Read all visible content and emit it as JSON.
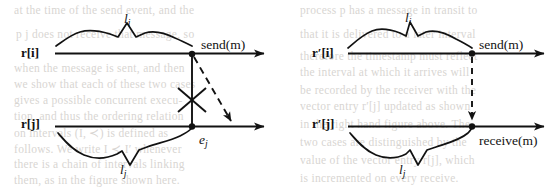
{
  "figure": {
    "name": "message-send-receive-timeline-diagram",
    "ink_color": "#121212",
    "paper_color": "#ffffff",
    "bleed_color": "#b9b4ae"
  },
  "left_diagram": {
    "name": "left-diagram",
    "timelines": [
      {
        "axis_label": "r[i]",
        "interval_label": "l",
        "interval_sub": "i"
      },
      {
        "axis_label": "r[j]",
        "interval_label": "l",
        "interval_sub": "j"
      }
    ],
    "events": [
      {
        "label": "send(m)",
        "name": "send-event-label"
      },
      {
        "label": "e",
        "sub": "j",
        "name": "ej-event-label"
      }
    ],
    "message_arrow": {
      "style": "dashed",
      "blocked": true,
      "blocked_marker": "x-cross"
    }
  },
  "right_diagram": {
    "name": "right-diagram",
    "timelines": [
      {
        "axis_label": "r′[i]",
        "interval_label": "l",
        "interval_sub": "i"
      },
      {
        "axis_label": "r′[j]",
        "interval_label": "l",
        "interval_sub": "j"
      }
    ],
    "events": [
      {
        "label": "send(m)",
        "name": "send-event-label"
      },
      {
        "label": "receive(m)",
        "name": "receive-event-label"
      }
    ],
    "message_arrow": {
      "style": "dashed",
      "blocked": false,
      "blocked_marker": ""
    }
  },
  "background_text": {
    "lines": [
      {
        "text": "at the time of the send event, and the",
        "x": 14,
        "y": 4
      },
      {
        "text": "process p  has a message in transit to",
        "x": 300,
        "y": 4
      },
      {
        "text": "p  j  does not receive that message, so",
        "x": 16,
        "y": 28
      },
      {
        "text": "that it is delivered to a later interval",
        "x": 300,
        "y": 28
      },
      {
        "text": "therefore the timestamp must reflect",
        "x": 300,
        "y": 50
      },
      {
        "text": "when the message is sent, and then",
        "x": 14,
        "y": 62
      },
      {
        "text": "the interval at which it arrives will",
        "x": 300,
        "y": 66
      },
      {
        "text": "we show that each of these two cases",
        "x": 14,
        "y": 78
      },
      {
        "text": "be recorded by the receiver with the",
        "x": 300,
        "y": 84
      },
      {
        "text": "gives a possible concurrent execu-",
        "x": 14,
        "y": 94
      },
      {
        "text": "vector entry r′[j] updated as shown",
        "x": 300,
        "y": 100
      },
      {
        "text": "tion, and thus the ordering relation",
        "x": 14,
        "y": 110
      },
      {
        "text": "in the right hand figure above. The",
        "x": 300,
        "y": 118
      },
      {
        "text": "on intervals (I, ≺) is defined as",
        "x": 14,
        "y": 126
      },
      {
        "text": "two cases are distinguished by the",
        "x": 300,
        "y": 136
      },
      {
        "text": "follows.  We write I ≺ I′ whenever",
        "x": 14,
        "y": 142
      },
      {
        "text": "value of the vector entry r[j], which",
        "x": 300,
        "y": 154
      },
      {
        "text": "there is a chain of intervals linking",
        "x": 14,
        "y": 158
      },
      {
        "text": "is incremented on every receive.",
        "x": 300,
        "y": 172
      },
      {
        "text": "them, as in the figure shown here.",
        "x": 14,
        "y": 174
      }
    ]
  }
}
